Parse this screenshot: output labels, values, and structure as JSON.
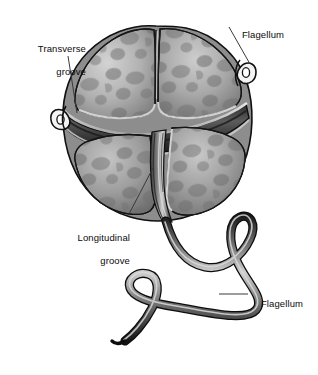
{
  "figure": {
    "background_color": "#ffffff",
    "ink_color": "#0b0b0b"
  },
  "labels": [
    {
      "id": "transverse-groove",
      "text": "Transverse\ngroove",
      "align": "right"
    },
    {
      "id": "flagellum-top",
      "text": "Flagellum",
      "align": "left"
    },
    {
      "id": "longitudinal-groove",
      "text": "Longitudinal\ngroove",
      "align": "right"
    },
    {
      "id": "flagellum-bottom",
      "text": "Flagellum",
      "align": "left"
    }
  ],
  "label_text": {
    "transverse_groove_line1": "Transverse",
    "transverse_groove_line2": "groove",
    "flagellum_top": "Flagellum",
    "longitudinal_groove_line1": "Longitudinal",
    "longitudinal_groove_line2": "groove",
    "flagellum_bottom": "Flagellum"
  },
  "palette": {
    "outline": "#111111",
    "plate_light": "#c8c8c8",
    "plate_mid": "#9a9a9a",
    "plate_dark": "#6f6f6f",
    "blotch": "#7a7a7a",
    "groove_shadow": "#3a3a3a",
    "flagellum_core": "#b5b5b5",
    "flagellum_edge": "#141414",
    "leader_line": "#3a3a3a"
  },
  "anatomy": {
    "parts": [
      "epitheca",
      "hypotheca",
      "transverse groove (cingulum)",
      "longitudinal groove (sulcus)",
      "transverse flagellum",
      "longitudinal flagellum"
    ]
  }
}
